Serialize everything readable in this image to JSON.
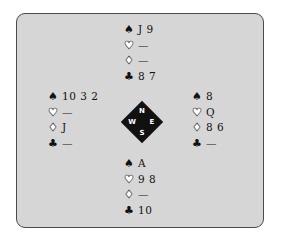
{
  "diagram": {
    "type": "bridge-deal",
    "suit_icons": {
      "spades": "♠",
      "hearts": "♡",
      "diamonds": "♢",
      "clubs": "♣"
    },
    "hands": {
      "north": {
        "spades": "J 9",
        "hearts": "—",
        "diamonds": "—",
        "clubs": "8 7"
      },
      "west": {
        "spades": "10 3 2",
        "hearts": "—",
        "diamonds": "J",
        "clubs": "—"
      },
      "east": {
        "spades": "8",
        "hearts": "Q",
        "diamonds": "8 6",
        "clubs": "—"
      },
      "south": {
        "spades": "A",
        "hearts": "9 8",
        "diamonds": "—",
        "clubs": "10"
      }
    },
    "compass": {
      "n": "N",
      "w": "W",
      "e": "E",
      "s": "S"
    },
    "colors": {
      "panel_bg": "#d6d6d6",
      "border": "#4a4a4a",
      "compass_bg": "#111111"
    }
  }
}
